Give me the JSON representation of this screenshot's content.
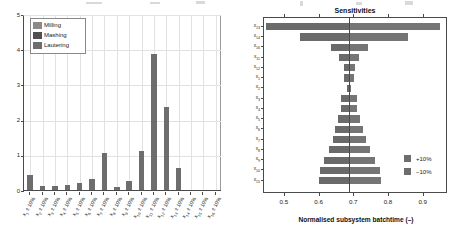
{
  "figure": {
    "background": "#ffffff",
    "bar_color": "#6d6d6d",
    "axis_color": "#4a4a4a",
    "grid_color": "#e2e2e2"
  },
  "left_panel": {
    "ylabel": "Sensitivity index",
    "ytick_labels": [
      "0",
      "1",
      "2",
      "3",
      "4",
      "5"
    ],
    "legend": {
      "items": [
        {
          "label": "Milling",
          "color": "#8a8a8a"
        },
        {
          "label": "Mashing",
          "color": "#4f4f4f"
        },
        {
          "label": "Lautering",
          "color": "#6d6d6d"
        }
      ]
    }
  },
  "right_panel": {
    "title": "Sensitivities",
    "xlabel": "Normalised subsystem batchtime (–)",
    "xtick_labels": [
      "0.5",
      "0.6",
      "0.7",
      "0.8",
      "0.9"
    ],
    "legend": {
      "items": [
        {
          "label": "+10%",
          "color": "#6d6d6d"
        },
        {
          "label": "−10%",
          "color": "#6d6d6d"
        }
      ]
    }
  },
  "chart_data": [
    {
      "id": "sensitivity-index-bars",
      "type": "bar",
      "title": "",
      "xlabel": "",
      "ylabel": "Sensitivity index",
      "ylim": [
        0,
        5
      ],
      "yticks": [
        0,
        1,
        2,
        3,
        4,
        5
      ],
      "grid": true,
      "legend_position": "top-left",
      "legend_entries": [
        "Milling",
        "Mashing",
        "Lautering"
      ],
      "categories": [
        "x₁ ± 10%",
        "x₂ ± 10%",
        "x₃ ± 10%",
        "x₄ ± 10%",
        "x₅ ± 10%",
        "x₆ ± 10%",
        "x₇ ± 10%",
        "x₈ ± 10%",
        "x₉ ± 10%",
        "x₁₀ ± 10%",
        "x₁₁ ± 10%",
        "x₁₂ ± 10%",
        "x₁₃ ± 10%",
        "x₁₄ ± 10%",
        "x₁₅ ± 10%",
        "x₁₆ ± 10%"
      ],
      "values": [
        0.42,
        0.1,
        0.11,
        0.14,
        0.21,
        0.3,
        1.05,
        0.09,
        0.25,
        1.12,
        3.85,
        2.35,
        0.62,
        0.0,
        0.0,
        0.0
      ]
    },
    {
      "id": "tornado-sensitivities",
      "type": "bar",
      "orientation": "horizontal",
      "title": "Sensitivities",
      "xlabel": "Normalised subsystem batchtime (–)",
      "ylabel": "",
      "xlim": [
        0.44,
        0.97
      ],
      "xticks": [
        0.5,
        0.6,
        0.7,
        0.8,
        0.9
      ],
      "baseline": 0.685,
      "grid": false,
      "legend_position": "right-lower",
      "series": [
        {
          "name": "+10%",
          "color": "#6d6d6d"
        },
        {
          "name": "−10%",
          "color": "#6d6d6d"
        }
      ],
      "rows": [
        {
          "label": "x₁₃",
          "low": 0.445,
          "high": 0.948
        },
        {
          "label": "x₁₄",
          "low": 0.545,
          "high": 0.855
        },
        {
          "label": "x₁₆",
          "low": 0.633,
          "high": 0.74
        },
        {
          "label": "x₁₁",
          "low": 0.655,
          "high": 0.714
        },
        {
          "label": "x₁₂",
          "low": 0.669,
          "high": 0.702
        },
        {
          "label": "x₁",
          "low": 0.671,
          "high": 0.699
        },
        {
          "label": "x₂",
          "low": 0.678,
          "high": 0.692
        },
        {
          "label": "x₃",
          "low": 0.663,
          "high": 0.707
        },
        {
          "label": "x₄",
          "low": 0.661,
          "high": 0.709
        },
        {
          "label": "x₅",
          "low": 0.654,
          "high": 0.716
        },
        {
          "label": "x₆",
          "low": 0.645,
          "high": 0.726
        },
        {
          "label": "x₇",
          "low": 0.64,
          "high": 0.733
        },
        {
          "label": "x₈",
          "low": 0.628,
          "high": 0.745
        },
        {
          "label": "x₉",
          "low": 0.612,
          "high": 0.761
        },
        {
          "label": "x₁₀",
          "low": 0.6,
          "high": 0.773
        },
        {
          "label": "x₁₅",
          "low": 0.597,
          "high": 0.776
        }
      ]
    }
  ]
}
